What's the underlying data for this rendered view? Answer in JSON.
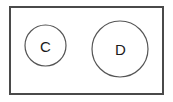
{
  "diagram": {
    "type": "set-diagram",
    "background_color": "#ffffff",
    "universe": {
      "name": "universal-set-rectangle",
      "shape": "rectangle",
      "x": 9,
      "y": 6,
      "width": 155,
      "height": 89,
      "stroke_color": "#4a4a4a",
      "stroke_width": 2,
      "fill_color": "#ffffff",
      "label": ""
    },
    "sets": [
      {
        "name": "set-c",
        "label": "C",
        "shape": "circle",
        "cx": 45.5,
        "cy": 45.5,
        "r": 20.5,
        "stroke_color": "#555555",
        "stroke_width": 1.2,
        "fill_color": "#ffffff",
        "label_x": 45.5,
        "label_y": 45.5,
        "label_font_size": 15,
        "label_color": "#1a1a1a"
      },
      {
        "name": "set-d",
        "label": "D",
        "shape": "circle",
        "cx": 120,
        "cy": 49,
        "r": 28,
        "stroke_color": "#555555",
        "stroke_width": 1.2,
        "fill_color": "#ffffff",
        "label_x": 120.5,
        "label_y": 49,
        "label_font_size": 15,
        "label_color": "#1a1a1a"
      }
    ],
    "relationship": "disjoint"
  }
}
